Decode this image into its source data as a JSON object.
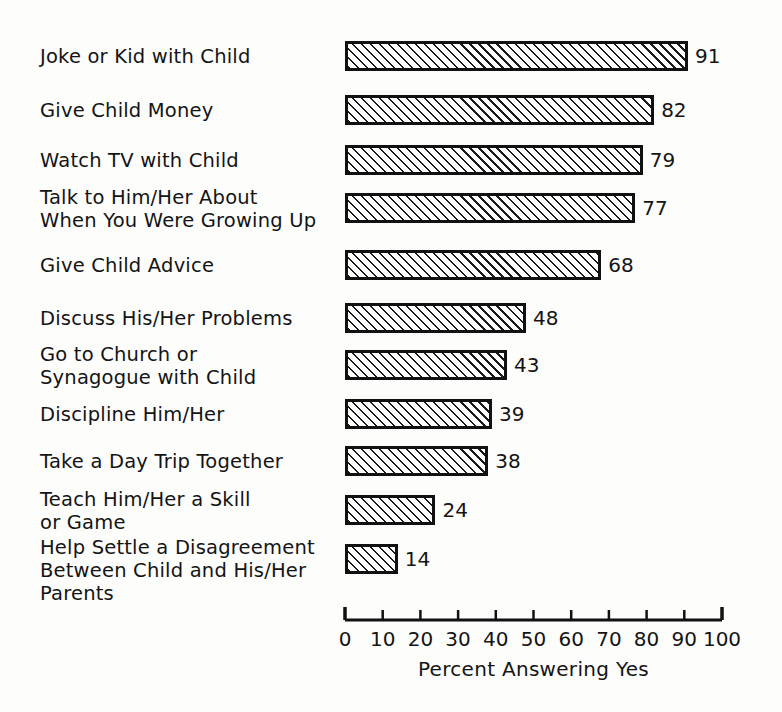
{
  "chart_data": {
    "type": "bar",
    "orientation": "horizontal",
    "title": "",
    "subtitle": "",
    "xlabel": "Percent Answering Yes",
    "ylabel": "",
    "xlim": [
      0,
      100
    ],
    "xticks": [
      "0",
      "10",
      "20",
      "30",
      "40",
      "50",
      "60",
      "70",
      "80",
      "90",
      "100"
    ],
    "xtick_values": [
      0,
      10,
      20,
      30,
      40,
      50,
      60,
      70,
      80,
      90,
      100
    ],
    "grid": false,
    "legend": null,
    "legend_position": "none",
    "bar_style": {
      "fill": "diagonal-hatch",
      "hatch_color": "#1a1a1a",
      "background_color": "#ffffff",
      "border_color": "#111111"
    },
    "categories": [
      "Joke or Kid with Child",
      "Give Child Money",
      "Watch TV with Child",
      "Talk to Him/Her About\nWhen You Were Growing Up",
      "Give Child Advice",
      "Discuss His/Her Problems",
      "Go to Church or\nSynagogue with Child",
      "Discipline Him/Her",
      "Take a Day Trip Together",
      "Teach Him/Her a Skill\nor Game",
      "Help Settle a Disagreement\nBetween Child and His/Her\nParents"
    ],
    "values": [
      91,
      82,
      79,
      77,
      68,
      48,
      43,
      39,
      38,
      24,
      14
    ],
    "value_labels": [
      "91",
      "82",
      "79",
      "77",
      "68",
      "48",
      "43",
      "39",
      "38",
      "24",
      "14"
    ]
  },
  "layout": {
    "plot_left_px": 345,
    "plot_right_px": 722,
    "baseline_y_px": 620,
    "bar_height_px": 30,
    "row_centers_px": [
      56,
      110,
      160,
      208,
      265,
      318,
      365,
      414,
      461,
      510,
      559
    ]
  },
  "colors": {
    "ink": "#141414",
    "border": "#111111",
    "background": "#fdfdfc"
  }
}
